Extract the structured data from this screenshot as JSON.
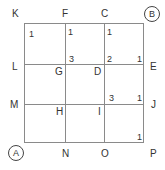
{
  "diagram": {
    "type": "grid-path-puzzle",
    "grid": {
      "rows": 3,
      "cols": 3
    },
    "corner_start": "A",
    "corner_end": "B",
    "point_labels": {
      "K": "K",
      "F": "F",
      "C": "C",
      "B": "B",
      "L": "L",
      "G": "G",
      "D": "D",
      "E": "E",
      "M": "M",
      "H": "H",
      "I": "I",
      "J": "J",
      "A": "A",
      "N": "N",
      "O": "O",
      "P": "P"
    },
    "cell_numbers": [
      {
        "id": "n1",
        "value": "1",
        "position": "row1-col1 top-left"
      },
      {
        "id": "n2",
        "value": "1",
        "position": "row1-col2 top-left"
      },
      {
        "id": "n3",
        "value": "1",
        "position": "row1-col3 top-left"
      },
      {
        "id": "n4",
        "value": "3",
        "position": "row1-col2 bottom-left"
      },
      {
        "id": "n5",
        "value": "2",
        "position": "row1-col3 bottom-left"
      },
      {
        "id": "n6",
        "value": "1",
        "position": "row1-col3 bottom-right"
      },
      {
        "id": "n7",
        "value": "3",
        "position": "row2-col3 bottom-left"
      },
      {
        "id": "n8",
        "value": "1",
        "position": "row2-col3 bottom-right"
      },
      {
        "id": "n9",
        "value": "1",
        "position": "row3-col3 bottom-right"
      }
    ]
  }
}
